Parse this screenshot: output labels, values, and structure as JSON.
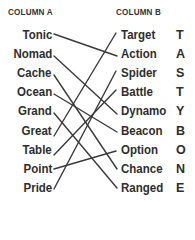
{
  "headers": {
    "column_a": "COLUMN A",
    "column_b": "COLUMN B"
  },
  "column_a": [
    "Tonic",
    "Nomad",
    "Cache",
    "Ocean",
    "Grand",
    "Great",
    "Table",
    "Point",
    "Pride"
  ],
  "column_b": [
    "Target",
    "Action",
    "Spider",
    "Battle",
    "Dynamo",
    "Beacon",
    "Option",
    "Chance",
    "Ranged"
  ],
  "letters": [
    "T",
    "A",
    "S",
    "T",
    "Y",
    "B",
    "O",
    "N",
    "E"
  ],
  "matches": [
    {
      "from": "Tonic",
      "to": "Action"
    },
    {
      "from": "Nomad",
      "to": "Dynamo"
    },
    {
      "from": "Cache",
      "to": "Chance"
    },
    {
      "from": "Ocean",
      "to": "Beacon"
    },
    {
      "from": "Grand",
      "to": "Ranged"
    },
    {
      "from": "Great",
      "to": "Target"
    },
    {
      "from": "Table",
      "to": "Battle"
    },
    {
      "from": "Point",
      "to": "Option"
    },
    {
      "from": "Pride",
      "to": "Spider"
    }
  ],
  "colors": {
    "text": "#2e2e2e",
    "line": "#3a3a3a",
    "background": "#ffffff"
  }
}
